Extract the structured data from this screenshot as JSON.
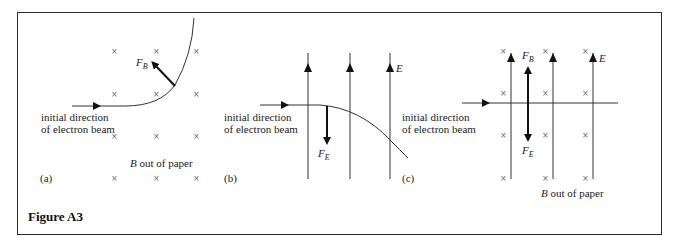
{
  "figure": {
    "caption": "Figure A3",
    "panels": [
      {
        "id": "a",
        "label": "(a)",
        "beam_label_line1": "initial direction",
        "beam_label_line2": "of electron beam",
        "force_label": "F",
        "force_sub": "B",
        "field_label_italic": "B",
        "field_label_rest": " out of paper",
        "field_symbol": "×"
      },
      {
        "id": "b",
        "label": "(b)",
        "beam_label_line1": "initial direction",
        "beam_label_line2": "of electron beam",
        "force_label": "F",
        "force_sub": "E",
        "field_line_label": "E"
      },
      {
        "id": "c",
        "label": "(c)",
        "beam_label_line1": "initial direction",
        "beam_label_line2": "of electron beam",
        "force_up_label": "F",
        "force_up_sub": "B",
        "force_down_label": "F",
        "force_down_sub": "E",
        "field_line_label": "E",
        "field_label_italic": "B",
        "field_label_rest": " out of paper",
        "field_symbol": "×"
      }
    ]
  }
}
